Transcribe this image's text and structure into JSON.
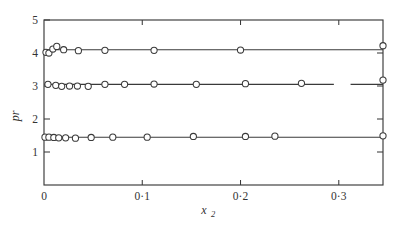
{
  "chart_data": {
    "type": "scatter",
    "title": "",
    "subtitle": "",
    "xlabel": "x₂",
    "xlabel_base": "x",
    "xlabel_sub": "2",
    "ylabel": "pr",
    "xlim": [
      0,
      0.345
    ],
    "ylim": [
      0,
      5
    ],
    "grid": false,
    "legend": "none",
    "xticks": [
      0,
      0.1,
      0.2,
      0.3
    ],
    "xticklabels": [
      "0",
      "0·1",
      "0·2",
      "0·3"
    ],
    "yticks": [
      1,
      2,
      3,
      4,
      5
    ],
    "yticklabels": [
      "1",
      "2",
      "3",
      "4",
      "5"
    ],
    "marker": "open-circle",
    "series": [
      {
        "name": "upper",
        "fit_value": 4.1,
        "fit_x_start": 0.0,
        "fit_x_end": 0.345,
        "x": [
          0.002,
          0.005,
          0.009,
          0.013,
          0.02,
          0.035,
          0.062,
          0.112,
          0.2,
          0.345
        ],
        "y": [
          4.02,
          4.0,
          4.12,
          4.2,
          4.1,
          4.07,
          4.08,
          4.08,
          4.09,
          4.22
        ]
      },
      {
        "name": "middle",
        "fit_value": 3.05,
        "fit_x_start": 0.0,
        "fit_x_end": 0.345,
        "fit_break_start": 0.295,
        "fit_break_end": 0.312,
        "x": [
          0.004,
          0.012,
          0.018,
          0.026,
          0.034,
          0.045,
          0.062,
          0.082,
          0.112,
          0.155,
          0.205,
          0.262,
          0.345
        ],
        "y": [
          3.05,
          3.02,
          2.99,
          3.0,
          3.0,
          2.99,
          3.05,
          3.05,
          3.06,
          3.05,
          3.07,
          3.08,
          3.18
        ]
      },
      {
        "name": "lower",
        "fit_value": 1.45,
        "fit_x_start": 0.0,
        "fit_x_end": 0.345,
        "x": [
          0.001,
          0.005,
          0.01,
          0.015,
          0.022,
          0.032,
          0.048,
          0.07,
          0.105,
          0.152,
          0.205,
          0.235,
          0.345
        ],
        "y": [
          1.45,
          1.45,
          1.44,
          1.43,
          1.43,
          1.42,
          1.44,
          1.45,
          1.45,
          1.47,
          1.47,
          1.48,
          1.49
        ]
      }
    ],
    "colors": {
      "axis": "#3a3a3a",
      "line": "#3a3a3a",
      "marker_fill": "#ffffff",
      "background": "#ffffff"
    }
  }
}
